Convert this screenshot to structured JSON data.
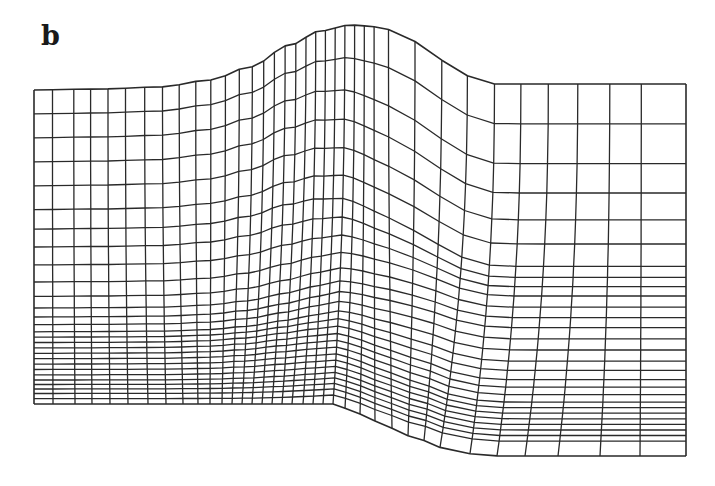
{
  "figure": {
    "panel_label": "b",
    "type": "structured computational mesh (terrain-following grid over a step)",
    "line_color": "#2a2a2a",
    "background": "#ffffff"
  },
  "mesh": {
    "top_boundary": [
      [
        34,
        90
      ],
      [
        100,
        89
      ],
      [
        160,
        87
      ],
      [
        210,
        80
      ],
      [
        250,
        67
      ],
      [
        290,
        45
      ],
      [
        320,
        31
      ],
      [
        350,
        25
      ],
      [
        380,
        27
      ],
      [
        410,
        40
      ],
      [
        440,
        60
      ],
      [
        470,
        76
      ],
      [
        490,
        84
      ],
      [
        540,
        84
      ],
      [
        686,
        84
      ]
    ],
    "bottom_boundary": [
      [
        34,
        404
      ],
      [
        150,
        404
      ],
      [
        250,
        404
      ],
      [
        333,
        404
      ],
      [
        360,
        414
      ],
      [
        390,
        428
      ],
      [
        420,
        440
      ],
      [
        450,
        450
      ],
      [
        480,
        455
      ],
      [
        500,
        456
      ],
      [
        686,
        456
      ]
    ],
    "columns_top_x": [
      34,
      53,
      75,
      92,
      110,
      128,
      148,
      166,
      183,
      200,
      215,
      230,
      244,
      257,
      268,
      279,
      290,
      301,
      311,
      321,
      331,
      341,
      351,
      361,
      371,
      381,
      408,
      436,
      462,
      490,
      517,
      545,
      575,
      608,
      640,
      686
    ],
    "columns_bottom_x": [
      34,
      53,
      75,
      92,
      110,
      128,
      148,
      166,
      183,
      198,
      210,
      222,
      232,
      242,
      252,
      262,
      272,
      282,
      292,
      303,
      313,
      323,
      333,
      345,
      360,
      375,
      392,
      408,
      424,
      440,
      470,
      497,
      525,
      558,
      600,
      640,
      686
    ],
    "rows_left": [
      0,
      0.133,
      0.267,
      0.4,
      0.5,
      0.6,
      0.68,
      0.73,
      0.77,
      0.8,
      0.83,
      0.86,
      0.89,
      0.92,
      0.945,
      0.97,
      1
    ],
    "rows_right": [
      0,
      0.107,
      0.214,
      0.293,
      0.365,
      0.43,
      0.49,
      0.52,
      0.545,
      0.57,
      0.6,
      0.628,
      0.655,
      0.685,
      0.715,
      0.745,
      0.77,
      0.795,
      0.815,
      0.835,
      0.855,
      0.87,
      0.885,
      0.9,
      0.915,
      0.93,
      0.945,
      0.96,
      1
    ],
    "left_row_count": 17,
    "right_row_count": 29
  }
}
